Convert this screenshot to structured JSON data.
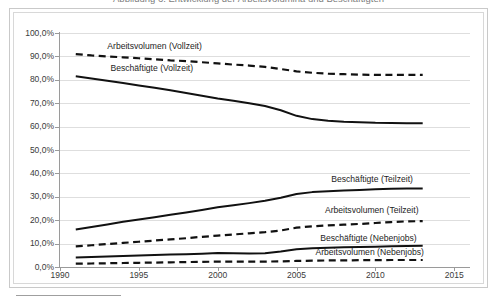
{
  "figure": {
    "title_partial": "Abbildung 6: Entwicklung der Arbeitsvolumina und Beschäftigten",
    "frame_color": "#c9c9c9",
    "background": "#ffffff"
  },
  "chart_data": {
    "type": "line",
    "title": "Abbildung 6: Entwicklung der Arbeitsvolumina und Beschäftigten",
    "xlabel": "",
    "ylabel": "",
    "xlim": [
      1990,
      2016
    ],
    "ylim": [
      0,
      100
    ],
    "ytick_labels": [
      "100,0%",
      "90,0%",
      "80,0%",
      "70,0%",
      "60,0%",
      "50,0%",
      "40,0%",
      "30,0%",
      "20,0%",
      "10,0%",
      "0,0%"
    ],
    "ytick_values": [
      100,
      90,
      80,
      70,
      60,
      50,
      40,
      30,
      20,
      10,
      0
    ],
    "xtick_labels": [
      "1990",
      "1995",
      "2000",
      "2005",
      "2010",
      "2015"
    ],
    "xtick_values": [
      1990,
      1995,
      2000,
      2005,
      2010,
      2015
    ],
    "grid": true,
    "legend": "inline-labels",
    "x": [
      1991,
      1992,
      1993,
      1994,
      1995,
      1996,
      1997,
      1998,
      1999,
      2000,
      2001,
      2002,
      2003,
      2004,
      2005,
      2006,
      2007,
      2008,
      2009,
      2010,
      2011,
      2012,
      2013
    ],
    "series": [
      {
        "name": "Arbeitsvolumen (Vollzeit)",
        "style": "dashed",
        "color": "#111111",
        "values": [
          91.0,
          90.4,
          90.0,
          89.6,
          89.2,
          88.8,
          88.3,
          88.0,
          87.5,
          87.0,
          86.5,
          86.1,
          85.5,
          84.6,
          83.6,
          83.0,
          82.6,
          82.4,
          82.2,
          82.1,
          82.1,
          82.1,
          82.1
        ],
        "label_x": 1993.0,
        "label_y": 94.5
      },
      {
        "name": "Beschäftigte (Vollzeit)",
        "style": "solid",
        "color": "#111111",
        "values": [
          81.5,
          80.6,
          79.6,
          78.6,
          77.6,
          76.6,
          75.5,
          74.4,
          73.2,
          72.0,
          71.0,
          70.0,
          68.8,
          67.0,
          64.6,
          63.2,
          62.5,
          62.1,
          61.9,
          61.6,
          61.5,
          61.4,
          61.4
        ],
        "label_x": 1993.2,
        "label_y": 85.2
      },
      {
        "name": "Beschäftigte (Teilzeit)",
        "style": "solid",
        "color": "#111111",
        "values": [
          16.0,
          17.1,
          18.2,
          19.3,
          20.3,
          21.3,
          22.3,
          23.3,
          24.4,
          25.5,
          26.4,
          27.3,
          28.3,
          29.6,
          31.2,
          32.0,
          32.4,
          32.7,
          32.9,
          33.2,
          33.4,
          33.5,
          33.5
        ],
        "label_x": 2007.2,
        "label_y": 37.5
      },
      {
        "name": "Arbeitsvolumen (Teilzeit)",
        "style": "dashed",
        "color": "#111111",
        "values": [
          8.8,
          9.3,
          9.8,
          10.3,
          10.8,
          11.3,
          11.8,
          12.3,
          12.9,
          13.4,
          13.9,
          14.4,
          14.9,
          15.6,
          16.8,
          17.4,
          17.8,
          18.1,
          18.4,
          18.8,
          19.2,
          19.5,
          19.6
        ],
        "label_x": 2006.8,
        "label_y": 24.5
      },
      {
        "name": "Beschäftigte (Nebenjobs)",
        "style": "solid",
        "color": "#111111",
        "values": [
          4.1,
          4.3,
          4.5,
          4.7,
          4.9,
          5.1,
          5.3,
          5.5,
          5.7,
          6.0,
          5.9,
          5.8,
          5.9,
          6.6,
          7.6,
          8.0,
          8.2,
          8.4,
          8.5,
          8.7,
          8.9,
          9.0,
          9.1
        ],
        "label_x": 2006.5,
        "label_y": 12.4
      },
      {
        "name": "Arbeitsvolumen (Nebenjobs)",
        "style": "dashed",
        "color": "#111111",
        "values": [
          1.4,
          1.5,
          1.6,
          1.7,
          1.8,
          1.9,
          2.0,
          2.1,
          2.2,
          2.3,
          2.3,
          2.3,
          2.3,
          2.4,
          2.6,
          2.7,
          2.8,
          2.8,
          2.9,
          2.9,
          3.0,
          3.0,
          3.0
        ],
        "label_x": 2006.2,
        "label_y": 6.3
      }
    ]
  }
}
